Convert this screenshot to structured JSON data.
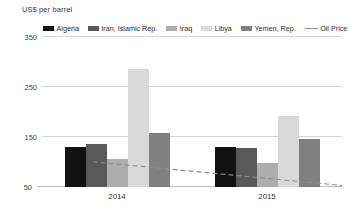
{
  "chart_data": {
    "type": "bar",
    "title": "",
    "ylabel": "US$ per barrel",
    "xlabel": "",
    "categories": [
      "2014",
      "2015"
    ],
    "ylim": [
      50,
      350
    ],
    "yticks": [
      50,
      150,
      250,
      350
    ],
    "grid": true,
    "legend_position": "top",
    "series": [
      {
        "name": "Algeria",
        "type": "bar",
        "color": "#111111",
        "values": [
          130,
          130
        ]
      },
      {
        "name": "Iran, Islamic Rep.",
        "type": "bar",
        "color": "#595959",
        "values": [
          136,
          128
        ]
      },
      {
        "name": "Iraq",
        "type": "bar",
        "color": "#adadad",
        "values": [
          105,
          97
        ]
      },
      {
        "name": "Libya",
        "type": "bar",
        "color": "#d9d9d9",
        "values": [
          285,
          192
        ]
      },
      {
        "name": "Yemen, Rep.",
        "type": "bar",
        "color": "#808080",
        "values": [
          157,
          145
        ]
      },
      {
        "name": "Oil Price",
        "type": "line",
        "color": "#8d8d8d",
        "style": "dashed",
        "values": [
          100,
          53
        ]
      }
    ]
  },
  "axis": {
    "ylabel": "US$ per barrel",
    "tick_350": "350",
    "tick_250": "250",
    "tick_150": "150",
    "tick_50": "50"
  },
  "legend": {
    "items": [
      {
        "label": "Algeria",
        "marker": "swatch"
      },
      {
        "label": "Iran, Islamic Rep.",
        "marker": "swatch"
      },
      {
        "label": "Iraq",
        "marker": "swatch"
      },
      {
        "label": "Libya",
        "marker": "swatch"
      },
      {
        "label": "Yemen, Rep.",
        "marker": "swatch"
      },
      {
        "label": "Oil Price",
        "marker": "line"
      }
    ]
  },
  "groups": [
    {
      "label": "2014"
    },
    {
      "label": "2015"
    }
  ]
}
